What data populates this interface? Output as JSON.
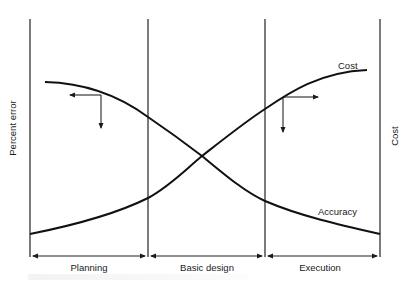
{
  "diagram": {
    "y_axis_left_label": "Percent error",
    "y_axis_right_label": "Cost",
    "curves": [
      {
        "name": "Cost",
        "label": "Cost",
        "trend": "increasing"
      },
      {
        "name": "Accuracy",
        "label": "Accuracy",
        "trend": "decreasing"
      }
    ],
    "phases": [
      {
        "label": "Planning"
      },
      {
        "label": "Basic design"
      },
      {
        "label": "Execution"
      }
    ],
    "colors": {
      "line": "#1a1a1a",
      "background": "#ffffff"
    }
  }
}
